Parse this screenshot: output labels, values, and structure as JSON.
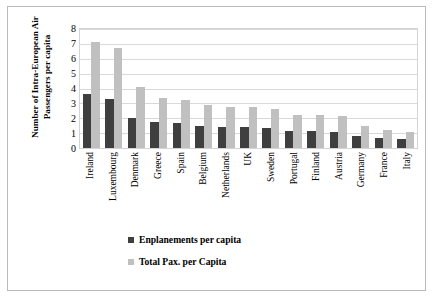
{
  "chart_data": {
    "type": "bar",
    "title": "",
    "xlabel": "",
    "ylabel": "Number of Intra-European Air Passengers per capita",
    "ylim": [
      0,
      8
    ],
    "yticks": [
      8,
      7,
      6,
      5,
      4,
      3,
      2,
      1,
      0
    ],
    "grid": true,
    "legend_position": "bottom",
    "categories": [
      "Ireland",
      "Luxembourg",
      "Denmark",
      "Greece",
      "Spain",
      "Belgium",
      "Netherlands",
      "UK",
      "Sweden",
      "Portugal",
      "Finland",
      "Austria",
      "Germany",
      "France",
      "Italy"
    ],
    "series": [
      {
        "name": "Enplanements per capita",
        "color": "#3f3f3f",
        "values": [
          3.6,
          3.3,
          2.05,
          1.75,
          1.65,
          1.5,
          1.4,
          1.4,
          1.35,
          1.15,
          1.15,
          1.1,
          0.8,
          0.65,
          0.6
        ]
      },
      {
        "name": "Total Pax. per Capita",
        "color": "#c0c0c0",
        "values": [
          7.15,
          6.75,
          4.1,
          3.35,
          3.25,
          2.9,
          2.75,
          2.75,
          2.65,
          2.2,
          2.2,
          2.15,
          1.45,
          1.2,
          1.05
        ]
      }
    ]
  },
  "legend": {
    "items": [
      {
        "label": "Enplanements per capita",
        "color": "#3f3f3f"
      },
      {
        "label": "Total Pax. per Capita",
        "color": "#c0c0c0"
      }
    ]
  },
  "colors": {
    "series_dark": "#3f3f3f",
    "series_light": "#c0c0c0",
    "gridline": "#d9d9d9",
    "frame": "#b9b9b9",
    "text": "#000000",
    "background": "#ffffff"
  }
}
